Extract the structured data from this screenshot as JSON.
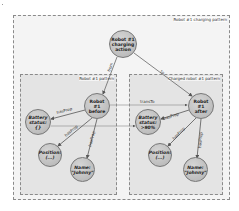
{
  "diagram": {
    "frames": {
      "outer": {
        "label": "Robot #1 charging pattern"
      },
      "left": {
        "label": "Robot #1 pattern"
      },
      "right": {
        "label": "Charged robot #1 pattern"
      }
    },
    "nodes": {
      "charging_action": {
        "label": "Robot #1\ncharging\naction"
      },
      "robot_before": {
        "label": "Robot\n#1\nbefore"
      },
      "robot_after": {
        "label": "Robot\n#1\nafter"
      },
      "battery_before": {
        "label": "Battery\nstatus:\n{}"
      },
      "battery_after": {
        "label": "Battery\nstatus:\n>90%"
      },
      "position_before": {
        "label": "Position:\n(...)"
      },
      "position_after": {
        "label": "Position:\n(...)"
      },
      "name_before": {
        "label": "Name:\n\"Johnny\""
      },
      "name_after": {
        "label": "Name:\n\"Johnny\""
      }
    },
    "edges": {
      "action_to_before": {
        "label": "from"
      },
      "action_to_after": {
        "label": "to"
      },
      "before_transto": {
        "label": "transTo"
      },
      "battery_transto": {
        "label": "transTo"
      },
      "before_battery": {
        "label": "hasProp"
      },
      "before_position": {
        "label": "hasProp"
      },
      "before_name": {
        "label": "hasProp"
      },
      "after_battery": {
        "label": "hasProp"
      },
      "after_position": {
        "label": "hasProp"
      },
      "after_name": {
        "label": "hasProp"
      }
    },
    "colors": {
      "outer_fill": "#f4f4f4",
      "inner_fill": "#e4e4e4",
      "node_fill": "#bdbdbd",
      "edge": "#555555"
    }
  }
}
